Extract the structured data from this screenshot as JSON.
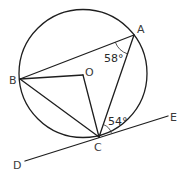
{
  "diagram": {
    "type": "circle-geometry",
    "circle": {
      "center": "O",
      "cx": 83,
      "cy": 73.5,
      "r": 64
    },
    "points": {
      "A": {
        "label": "A",
        "x": 134,
        "y": 35
      },
      "B": {
        "label": "B",
        "x": 20,
        "y": 79
      },
      "C": {
        "label": "C",
        "x": 99,
        "y": 137
      },
      "O": {
        "label": "O",
        "x": 83,
        "y": 75
      },
      "D": {
        "label": "D",
        "x": 25,
        "y": 161
      },
      "E": {
        "label": "E",
        "x": 168,
        "y": 116
      }
    },
    "segments": [
      "AB",
      "AC",
      "BC",
      "BO",
      "OC",
      "DE"
    ],
    "tangent": {
      "line": "DE",
      "touches_at": "C"
    },
    "angles": {
      "BAC": {
        "value": "58°",
        "vertex": "A"
      },
      "ACE": {
        "value": "54°",
        "vertex": "C"
      }
    }
  }
}
